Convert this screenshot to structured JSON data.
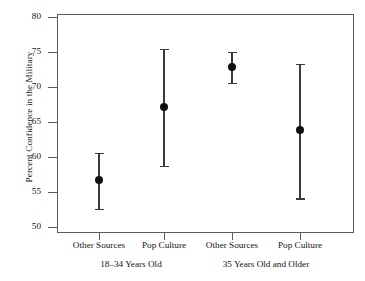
{
  "chart_data": {
    "type": "scatter",
    "title": "",
    "xlabel": "",
    "ylabel": "Percent Confidence in the Military",
    "ylim": [
      50,
      80
    ],
    "yticks": [
      50,
      55,
      60,
      65,
      70,
      75,
      80
    ],
    "ytick_labels": [
      "50",
      "55",
      "60",
      "65",
      "70",
      "75",
      "80"
    ],
    "grid": false,
    "legend": "none",
    "error_bars": "95% confidence interval",
    "categories": [
      "Other Sources",
      "Pop Culture",
      "Other Sources",
      "Pop Culture"
    ],
    "groups": [
      {
        "label": "18–34 Years Old",
        "categories": [
          "Other Sources",
          "Pop Culture"
        ]
      },
      {
        "label": "35 Years Old and Older",
        "categories": [
          "Other Sources",
          "Pop Culture"
        ]
      }
    ],
    "points": [
      {
        "label": "Other Sources",
        "group": "18–34 Years Old",
        "value": 56.7,
        "low": 52.6,
        "high": 60.6
      },
      {
        "label": "Pop Culture",
        "group": "18–34 Years Old",
        "value": 67.1,
        "low": 58.7,
        "high": 75.5
      },
      {
        "label": "Other Sources",
        "group": "35 Years Old and Older",
        "value": 72.8,
        "low": 70.6,
        "high": 75.0
      },
      {
        "label": "Pop Culture",
        "group": "35 Years Old and Older",
        "value": 63.8,
        "low": 54.1,
        "high": 73.3
      }
    ],
    "values": [
      56.7,
      67.1,
      72.8,
      63.8
    ],
    "colors": {
      "marker": "#111111",
      "error_bar": "#3a3a3a",
      "axis": "#5c5c5c",
      "background": "#ffffff"
    }
  },
  "axis": {
    "y_title": "Percent Confidence in the Military",
    "y_tick_0": "50",
    "y_tick_1": "55",
    "y_tick_2": "60",
    "y_tick_3": "65",
    "y_tick_4": "70",
    "y_tick_5": "75",
    "y_tick_6": "80",
    "x_tick_0": "Other Sources",
    "x_tick_1": "Pop Culture",
    "x_tick_2": "Other Sources",
    "x_tick_3": "Pop Culture",
    "group_0": "18–34 Years Old",
    "group_1": "35 Years Old and Older"
  }
}
